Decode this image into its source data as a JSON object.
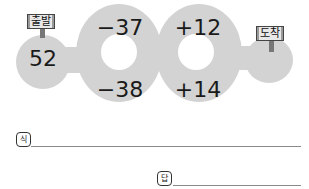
{
  "puzzle": {
    "start": {
      "sign": "출발",
      "value": "52"
    },
    "end": {
      "sign": "도착"
    },
    "ring1": {
      "top": "−37",
      "bottom": "−38"
    },
    "ring2": {
      "top": "+12",
      "bottom": "+14"
    }
  },
  "answer_area": {
    "expression_label": "식",
    "answer_label": "답"
  },
  "colors": {
    "path_fill": "#d3d3d3",
    "sign_post": "#777777"
  }
}
